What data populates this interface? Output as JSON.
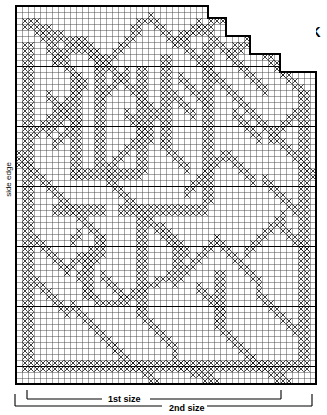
{
  "chart": {
    "title_right": "BACK",
    "side_label": "side edge",
    "size_1_label": "1st size",
    "size_2_label": "2nd size",
    "grid": {
      "columns": 50,
      "rows": 63,
      "cell_px": 6,
      "bold_every": 10,
      "line_color": "#3a3a3a",
      "bold_color": "#000000",
      "stitch_color": "#1a1a1a",
      "background": "#ffffff"
    },
    "chart_data": {
      "type": "heatmap",
      "title": "BACK",
      "xlabel": "",
      "ylabel": "side edge",
      "legend": [
        "1st size",
        "2nd size"
      ],
      "grid": true,
      "columns": 50,
      "rows": 63,
      "bold_every": 10,
      "annotations": [
        "BACK",
        "side edge",
        "1st size",
        "2nd size"
      ],
      "outline_steps": [
        {
          "row_start": 0,
          "col_end": 32
        },
        {
          "row_start": 2,
          "col_end": 35
        },
        {
          "row_start": 5,
          "col_end": 39
        },
        {
          "row_start": 8,
          "col_end": 44
        },
        {
          "row_start": 11,
          "col_end": 50
        }
      ],
      "filled_cells": [
        [
          0,
          24
        ],
        [
          0,
          25
        ],
        [
          0,
          26
        ],
        [
          1,
          2
        ],
        [
          1,
          3
        ],
        [
          1,
          25
        ],
        [
          1,
          26
        ],
        [
          2,
          2
        ],
        [
          2,
          3
        ],
        [
          2,
          26
        ],
        [
          2,
          27
        ],
        [
          3,
          2
        ],
        [
          3,
          3
        ],
        [
          3,
          27
        ],
        [
          3,
          28
        ],
        [
          3,
          20
        ],
        [
          3,
          21
        ],
        [
          4,
          3
        ],
        [
          4,
          4
        ],
        [
          4,
          19
        ],
        [
          4,
          20
        ],
        [
          4,
          28
        ],
        [
          4,
          29
        ],
        [
          5,
          3
        ],
        [
          5,
          4
        ],
        [
          5,
          18
        ],
        [
          5,
          19
        ],
        [
          5,
          29
        ],
        [
          5,
          30
        ],
        [
          6,
          4
        ],
        [
          6,
          5
        ],
        [
          6,
          17
        ],
        [
          6,
          18
        ],
        [
          6,
          30
        ],
        [
          6,
          31
        ],
        [
          6,
          8
        ],
        [
          6,
          9
        ],
        [
          7,
          4
        ],
        [
          7,
          5
        ],
        [
          7,
          8
        ],
        [
          7,
          9
        ],
        [
          7,
          16
        ],
        [
          7,
          17
        ],
        [
          7,
          31
        ],
        [
          7,
          32
        ],
        [
          8,
          5
        ],
        [
          8,
          6
        ],
        [
          8,
          9
        ],
        [
          8,
          10
        ],
        [
          8,
          15
        ],
        [
          8,
          16
        ],
        [
          8,
          32
        ],
        [
          8,
          33
        ],
        [
          9,
          5
        ],
        [
          9,
          6
        ],
        [
          9,
          10
        ],
        [
          9,
          11
        ],
        [
          9,
          14
        ],
        [
          9,
          15
        ],
        [
          9,
          33
        ],
        [
          9,
          34
        ],
        [
          9,
          38
        ],
        [
          9,
          39
        ],
        [
          10,
          6
        ],
        [
          10,
          7
        ],
        [
          10,
          11
        ],
        [
          10,
          12
        ],
        [
          10,
          13
        ],
        [
          10,
          14
        ],
        [
          10,
          34
        ],
        [
          10,
          35
        ],
        [
          10,
          37
        ],
        [
          10,
          38
        ],
        [
          10,
          44
        ],
        [
          10,
          45
        ],
        [
          11,
          6
        ],
        [
          11,
          7
        ],
        [
          11,
          12
        ],
        [
          11,
          13
        ],
        [
          11,
          35
        ],
        [
          11,
          36
        ],
        [
          11,
          43
        ],
        [
          11,
          44
        ],
        [
          11,
          46
        ],
        [
          11,
          47
        ],
        [
          12,
          7
        ],
        [
          12,
          8
        ],
        [
          12,
          36
        ],
        [
          12,
          37
        ],
        [
          12,
          42
        ],
        [
          12,
          43
        ],
        [
          12,
          47
        ],
        [
          12,
          48
        ],
        [
          13,
          7
        ],
        [
          13,
          8
        ],
        [
          13,
          37
        ],
        [
          13,
          38
        ],
        [
          13,
          41
        ],
        [
          13,
          42
        ],
        [
          13,
          48
        ],
        [
          13,
          49
        ],
        [
          14,
          8
        ],
        [
          14,
          9
        ],
        [
          14,
          38
        ],
        [
          14,
          39
        ],
        [
          14,
          40
        ],
        [
          14,
          41
        ],
        [
          14,
          49
        ],
        [
          15,
          9
        ],
        [
          15,
          10
        ],
        [
          15,
          26
        ],
        [
          15,
          27
        ],
        [
          15,
          28
        ],
        [
          15,
          29
        ],
        [
          15,
          49
        ],
        [
          16,
          10
        ],
        [
          16,
          11
        ],
        [
          16,
          25
        ],
        [
          16,
          26
        ],
        [
          16,
          29
        ],
        [
          16,
          30
        ],
        [
          16,
          49
        ],
        [
          17,
          11
        ],
        [
          17,
          12
        ],
        [
          17,
          24
        ],
        [
          17,
          25
        ],
        [
          17,
          30
        ],
        [
          17,
          31
        ],
        [
          17,
          48
        ],
        [
          17,
          49
        ],
        [
          18,
          12
        ],
        [
          18,
          13
        ],
        [
          18,
          23
        ],
        [
          18,
          24
        ],
        [
          18,
          31
        ],
        [
          18,
          32
        ],
        [
          18,
          48
        ],
        [
          19,
          13
        ],
        [
          19,
          14
        ],
        [
          19,
          22
        ],
        [
          19,
          23
        ],
        [
          19,
          32
        ],
        [
          19,
          33
        ],
        [
          19,
          47
        ],
        [
          19,
          48
        ],
        [
          20,
          14
        ],
        [
          20,
          15
        ],
        [
          20,
          21
        ],
        [
          20,
          22
        ],
        [
          20,
          33
        ],
        [
          20,
          34
        ],
        [
          20,
          47
        ],
        [
          21,
          15
        ],
        [
          21,
          16
        ],
        [
          21,
          20
        ],
        [
          21,
          21
        ],
        [
          21,
          34
        ],
        [
          21,
          35
        ],
        [
          21,
          46
        ],
        [
          21,
          47
        ],
        [
          22,
          16
        ],
        [
          22,
          17
        ],
        [
          22,
          18
        ],
        [
          22,
          19
        ],
        [
          22,
          20
        ],
        [
          22,
          35
        ],
        [
          22,
          36
        ],
        [
          22,
          46
        ],
        [
          23,
          17
        ],
        [
          23,
          18
        ],
        [
          23,
          36
        ],
        [
          23,
          37
        ],
        [
          23,
          45
        ],
        [
          23,
          46
        ],
        [
          24,
          37
        ],
        [
          24,
          38
        ],
        [
          24,
          45
        ],
        [
          25,
          38
        ],
        [
          25,
          39
        ],
        [
          25,
          44
        ],
        [
          25,
          45
        ],
        [
          26,
          39
        ],
        [
          26,
          40
        ],
        [
          26,
          41
        ],
        [
          26,
          42
        ],
        [
          26,
          43
        ],
        [
          26,
          44
        ],
        [
          27,
          5
        ],
        [
          27,
          6
        ],
        [
          27,
          40
        ],
        [
          27,
          41
        ],
        [
          27,
          42
        ],
        [
          27,
          43
        ],
        [
          28,
          4
        ],
        [
          28,
          5
        ],
        [
          28,
          6
        ],
        [
          28,
          7
        ],
        [
          29,
          4
        ],
        [
          29,
          7
        ],
        [
          29,
          8
        ],
        [
          30,
          3
        ],
        [
          30,
          4
        ],
        [
          30,
          8
        ],
        [
          30,
          9
        ],
        [
          31,
          3
        ],
        [
          31,
          9
        ],
        [
          31,
          10
        ],
        [
          32,
          2
        ],
        [
          32,
          3
        ],
        [
          32,
          10
        ],
        [
          32,
          11
        ],
        [
          33,
          2
        ],
        [
          33,
          11
        ],
        [
          33,
          12
        ],
        [
          34,
          1
        ],
        [
          34,
          2
        ],
        [
          34,
          12
        ],
        [
          34,
          13
        ],
        [
          35,
          1
        ],
        [
          35,
          13
        ],
        [
          35,
          14
        ],
        [
          36,
          0
        ],
        [
          36,
          1
        ],
        [
          36,
          14
        ],
        [
          36,
          15
        ],
        [
          37,
          0
        ],
        [
          37,
          15
        ],
        [
          37,
          16
        ],
        [
          38,
          16
        ],
        [
          38,
          17
        ],
        [
          39,
          17
        ],
        [
          39,
          18
        ],
        [
          40,
          18
        ],
        [
          40,
          19
        ],
        [
          41,
          19
        ],
        [
          41,
          20
        ],
        [
          42,
          20
        ],
        [
          42,
          21
        ],
        [
          43,
          21
        ],
        [
          43,
          22
        ],
        [
          44,
          22
        ],
        [
          44,
          23
        ],
        [
          45,
          23
        ],
        [
          45,
          24
        ],
        [
          46,
          24
        ],
        [
          46,
          25
        ],
        [
          47,
          25
        ],
        [
          47,
          26
        ],
        [
          48,
          26
        ],
        [
          48,
          27
        ],
        [
          49,
          27
        ],
        [
          49,
          28
        ]
      ]
    }
  }
}
